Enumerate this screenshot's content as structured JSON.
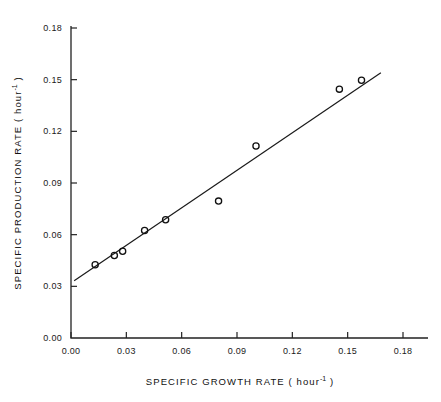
{
  "chart_data": {
    "type": "scatter",
    "title": "",
    "xlabel": "SPECIFIC GROWTH RATE ( hour-1 )",
    "ylabel": "SPECIFIC PRODUCTION RATE ( hour-1 )",
    "xlabel_parts": {
      "main": "SPECIFIC  GROWTH  RATE  ( hour",
      "exponent": "-1",
      "tail": " )"
    },
    "ylabel_parts": {
      "main": "SPECIFIC  PRODUCTION  RATE  ( hour",
      "exponent": "-1",
      "tail": " )"
    },
    "xlim": [
      0.0,
      0.18
    ],
    "ylim": [
      0.0,
      0.18
    ],
    "xticks": [
      0.0,
      0.03,
      0.06,
      0.09,
      0.12,
      0.15,
      0.18
    ],
    "yticks": [
      0.0,
      0.03,
      0.06,
      0.09,
      0.12,
      0.15,
      0.18
    ],
    "xtick_labels": [
      "0.00",
      "0.03",
      "0.06",
      "0.09",
      "0.12",
      "0.15",
      "0.18"
    ],
    "ytick_labels": [
      "0.00",
      "0.03",
      "0.06",
      "0.09",
      "0.12",
      "0.15",
      "0.18"
    ],
    "grid": false,
    "legend": null,
    "marker": "open-circle",
    "points": [
      {
        "x": 0.0131,
        "y": 0.0425
      },
      {
        "x": 0.0235,
        "y": 0.0479
      },
      {
        "x": 0.028,
        "y": 0.0504
      },
      {
        "x": 0.0399,
        "y": 0.0624
      },
      {
        "x": 0.0513,
        "y": 0.0687
      },
      {
        "x": 0.08,
        "y": 0.0795
      },
      {
        "x": 0.1003,
        "y": 0.1115
      },
      {
        "x": 0.1455,
        "y": 0.1445
      },
      {
        "x": 0.1575,
        "y": 0.1497
      }
    ],
    "fit_line": {
      "type": "linear",
      "x_start": 0.0017,
      "y_start": 0.0332,
      "x_end": 0.168,
      "y_end": 0.154,
      "slope": 0.727,
      "intercept": 0.032
    }
  }
}
